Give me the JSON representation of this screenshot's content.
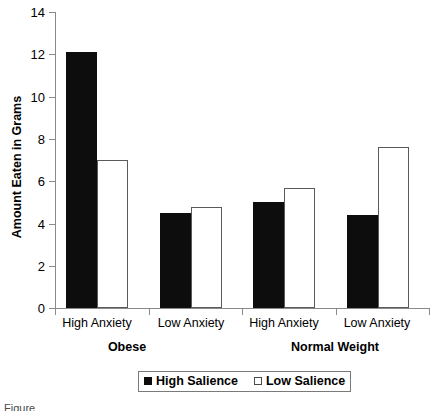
{
  "chart_data": {
    "type": "bar",
    "title": "",
    "subtitle": "",
    "xlabel": "",
    "ylabel": "Amount Eaten in Grams",
    "ylim": [
      0,
      14
    ],
    "ytick_labels": [
      "0",
      "2",
      "4",
      "6",
      "8",
      "10",
      "12",
      "14"
    ],
    "ytick_values": [
      0,
      2,
      4,
      6,
      8,
      10,
      12,
      14
    ],
    "grid": false,
    "legend_position": "bottom-center",
    "categories": [
      "High Anxiety",
      "Low Anxiety",
      "High Anxiety",
      "Low Anxiety"
    ],
    "groups": [
      {
        "label": "Obese",
        "categories": [
          "High Anxiety",
          "Low Anxiety"
        ]
      },
      {
        "label": "Normal Weight",
        "categories": [
          "High Anxiety",
          "Low Anxiety"
        ]
      }
    ],
    "series": [
      {
        "name": "High Salience",
        "style": "filled",
        "color": "#0d0d0d",
        "values": [
          12.1,
          4.5,
          5.0,
          4.4
        ]
      },
      {
        "name": "Low Salience",
        "style": "open",
        "color": "#ffffff",
        "values": [
          7.0,
          4.8,
          5.7,
          7.6
        ]
      }
    ],
    "bars": [
      {
        "group": "Obese",
        "category": "High Anxiety",
        "series": "High Salience",
        "value": 12.1
      },
      {
        "group": "Obese",
        "category": "High Anxiety",
        "series": "Low Salience",
        "value": 7.0
      },
      {
        "group": "Obese",
        "category": "Low Anxiety",
        "series": "High Salience",
        "value": 4.5
      },
      {
        "group": "Obese",
        "category": "Low Anxiety",
        "series": "Low Salience",
        "value": 4.8
      },
      {
        "group": "Normal Weight",
        "category": "High Anxiety",
        "series": "High Salience",
        "value": 5.0
      },
      {
        "group": "Normal Weight",
        "category": "High Anxiety",
        "series": "Low Salience",
        "value": 5.7
      },
      {
        "group": "Normal Weight",
        "category": "Low Anxiety",
        "series": "High Salience",
        "value": 4.4
      },
      {
        "group": "Normal Weight",
        "category": "Low Anxiety",
        "series": "Low Salience",
        "value": 7.6
      }
    ]
  },
  "axis": {
    "y_title": "Amount Eaten in Grams",
    "ticks": {
      "t0": "0",
      "t2": "2",
      "t4": "4",
      "t6": "6",
      "t8": "8",
      "t10": "10",
      "t12": "12",
      "t14": "14"
    }
  },
  "categories": {
    "obese_high": "High Anxiety",
    "obese_low": "Low Anxiety",
    "normal_high": "High Anxiety",
    "normal_low": "Low Anxiety"
  },
  "groups": {
    "obese": "Obese",
    "normal": "Normal Weight"
  },
  "legend": {
    "high_salience": "High Salience",
    "low_salience": "Low Salience"
  },
  "caption": "Figure"
}
